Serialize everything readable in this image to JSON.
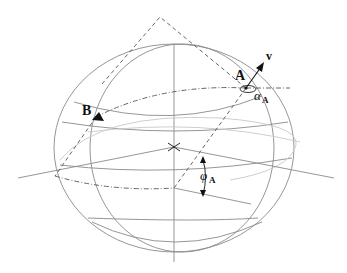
{
  "diagram": {
    "type": "spherical-geometry",
    "labels": {
      "point_a": "A",
      "point_b": "B",
      "vector": "v",
      "azimuth_symbol": "α",
      "azimuth_sub": "A",
      "latitude_symbol": "φ",
      "latitude_sub": "A"
    },
    "colors": {
      "grid_line": "#8a8a8a",
      "light_line": "#c8c8c8",
      "dashed_line": "#555555",
      "ink": "#111111"
    }
  }
}
